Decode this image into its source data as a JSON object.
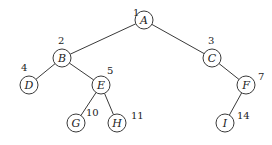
{
  "diagram": {
    "type": "binary-tree",
    "nodes": [
      {
        "id": "A",
        "label": "A",
        "number": "1",
        "x": 144,
        "y": 20,
        "nx": 133,
        "ny": 16
      },
      {
        "id": "B",
        "label": "B",
        "number": "2",
        "x": 62,
        "y": 58,
        "nx": 58,
        "ny": 44
      },
      {
        "id": "C",
        "label": "C",
        "number": "3",
        "x": 212,
        "y": 58,
        "nx": 208,
        "ny": 44
      },
      {
        "id": "D",
        "label": "D",
        "number": "4",
        "x": 29,
        "y": 85,
        "nx": 21,
        "ny": 71
      },
      {
        "id": "E",
        "label": "E",
        "number": "5",
        "x": 101,
        "y": 85,
        "nx": 107,
        "ny": 74
      },
      {
        "id": "F",
        "label": "F",
        "number": "7",
        "x": 246,
        "y": 85,
        "nx": 258,
        "ny": 80
      },
      {
        "id": "G",
        "label": "G",
        "number": "10",
        "x": 76,
        "y": 123,
        "nx": 86,
        "ny": 116
      },
      {
        "id": "H",
        "label": "H",
        "number": "11",
        "x": 117,
        "y": 123,
        "nx": 131,
        "ny": 119
      },
      {
        "id": "I",
        "label": "I",
        "number": "14",
        "x": 225,
        "y": 123,
        "nx": 237,
        "ny": 119
      }
    ],
    "edges": [
      [
        "A",
        "B"
      ],
      [
        "A",
        "C"
      ],
      [
        "B",
        "D"
      ],
      [
        "B",
        "E"
      ],
      [
        "C",
        "F"
      ],
      [
        "E",
        "G"
      ],
      [
        "E",
        "H"
      ],
      [
        "F",
        "I"
      ]
    ]
  }
}
